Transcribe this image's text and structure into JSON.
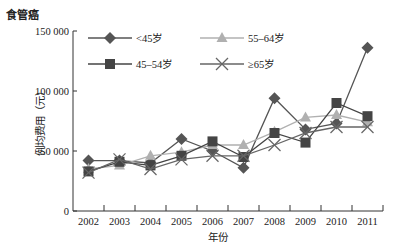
{
  "chart_data": {
    "type": "line",
    "title": "食管癌",
    "xlabel": "年份",
    "ylabel": "例均费用（元）",
    "ylim": [
      0,
      150000
    ],
    "yticks": [
      0,
      50000,
      100000,
      150000
    ],
    "ytick_labels": [
      "0",
      "50 000",
      "100 000",
      "150 000"
    ],
    "grid": false,
    "legend_position": "upper-left-inside",
    "x": [
      "2002",
      "2003",
      "2004",
      "2005",
      "2006",
      "2007",
      "2008",
      "2009",
      "2010",
      "2011"
    ],
    "series": [
      {
        "name": "<45岁",
        "marker": "diamond",
        "color": "#555555",
        "values": [
          42000,
          42000,
          40000,
          60000,
          50000,
          36000,
          94000,
          68000,
          73000,
          136000
        ]
      },
      {
        "name": "55–64岁",
        "marker": "triangle",
        "color": "#b0b0b0",
        "values": [
          35000,
          38000,
          46000,
          49000,
          55000,
          55000,
          66000,
          78000,
          80000,
          74000
        ]
      },
      {
        "name": "45–54岁",
        "marker": "square",
        "color": "#444444",
        "values": [
          33000,
          41000,
          38000,
          46000,
          58000,
          45000,
          65000,
          57000,
          90000,
          79000
        ]
      },
      {
        "name": "≥65岁",
        "marker": "x",
        "color": "#666666",
        "values": [
          32000,
          43000,
          35000,
          43000,
          46000,
          46000,
          55000,
          65000,
          70000,
          70000
        ]
      }
    ]
  }
}
